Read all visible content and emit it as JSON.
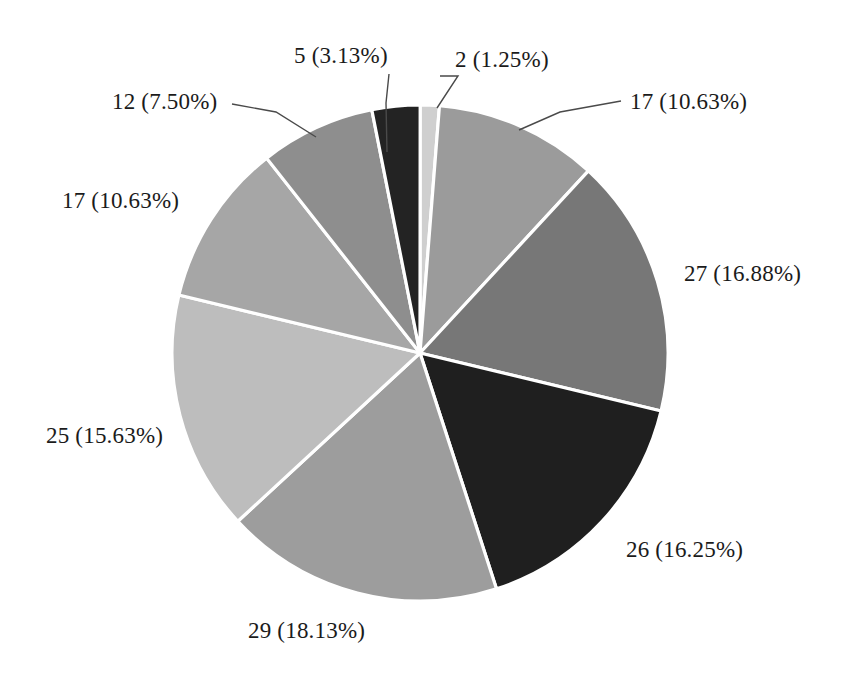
{
  "chart_data": {
    "type": "pie",
    "title": "",
    "subtitle": "",
    "xlabel": "",
    "ylabel": "",
    "legend": "none",
    "grid": false,
    "total": 160,
    "start_angle_deg": 0,
    "direction": "clockwise",
    "categories": [
      "2 (1.25%)",
      "17 (10.63%)",
      "27 (16.88%)",
      "26 (16.25%)",
      "29 (18.13%)",
      "25 (15.63%)",
      "17 (10.63%)",
      "12 (7.50%)",
      "5 (3.13%)"
    ],
    "values": [
      2,
      17,
      27,
      26,
      29,
      25,
      17,
      12,
      5
    ],
    "percents": [
      1.25,
      10.63,
      16.88,
      16.25,
      18.13,
      15.63,
      10.63,
      7.5,
      3.13
    ],
    "slices": [
      {
        "label": "2 (1.25%)",
        "value": 2,
        "percent": 1.25,
        "color": "#cfcfcf",
        "sweep_deg": 4.5,
        "start_deg": 0
      },
      {
        "label": "17 (10.63%)",
        "value": 17,
        "percent": 10.63,
        "color": "#9b9b9b",
        "sweep_deg": 38.27,
        "start_deg": 4.5
      },
      {
        "label": "27 (16.88%)",
        "value": 27,
        "percent": 16.88,
        "color": "#777777",
        "sweep_deg": 60.75,
        "start_deg": 42.77
      },
      {
        "label": "26 (16.25%)",
        "value": 26,
        "percent": 16.25,
        "color": "#1f1f1f",
        "sweep_deg": 58.5,
        "start_deg": 103.52
      },
      {
        "label": "29 (18.13%)",
        "value": 29,
        "percent": 18.13,
        "color": "#9d9d9d",
        "sweep_deg": 65.25,
        "start_deg": 162.02
      },
      {
        "label": "25 (15.63%)",
        "value": 25,
        "percent": 15.63,
        "color": "#bdbdbd",
        "sweep_deg": 56.25,
        "start_deg": 227.27
      },
      {
        "label": "17 (10.63%)",
        "value": 17,
        "percent": 10.63,
        "color": "#a6a6a6",
        "sweep_deg": 38.27,
        "start_deg": 283.52
      },
      {
        "label": "12 (7.50%)",
        "value": 12,
        "percent": 7.5,
        "color": "#8e8e8e",
        "sweep_deg": 27.0,
        "start_deg": 321.79
      },
      {
        "label": "5 (3.13%)",
        "value": 5,
        "percent": 3.13,
        "color": "#232323",
        "sweep_deg": 11.25,
        "start_deg": 348.79
      }
    ],
    "colors": {
      "background": "#ffffff",
      "slice_border": "#ffffff",
      "label_text": "#1b1b1b",
      "leader_line": "#4a4a4a"
    },
    "geometry": {
      "center_x": 420,
      "center_y": 353,
      "radius": 248
    }
  },
  "labels": [
    {
      "text": "5 (3.13%)",
      "x": 294,
      "y": 44,
      "name": "pie-label-5"
    },
    {
      "text": "2 (1.25%)",
      "x": 455,
      "y": 48,
      "name": "pie-label-2"
    },
    {
      "text": "17 (10.63%)",
      "x": 630,
      "y": 90,
      "name": "pie-label-17-right"
    },
    {
      "text": "27 (16.88%)",
      "x": 684,
      "y": 262,
      "name": "pie-label-27"
    },
    {
      "text": "26 (16.25%)",
      "x": 626,
      "y": 538,
      "name": "pie-label-26"
    },
    {
      "text": "29 (18.13%)",
      "x": 248,
      "y": 619,
      "name": "pie-label-29"
    },
    {
      "text": "25 (15.63%)",
      "x": 46,
      "y": 424,
      "name": "pie-label-25"
    },
    {
      "text": "17 (10.63%)",
      "x": 62,
      "y": 189,
      "name": "pie-label-17-left"
    },
    {
      "text": "12 (7.50%)",
      "x": 112,
      "y": 90,
      "name": "pie-label-12"
    }
  ],
  "leaders": [
    {
      "name": "leader-line-5",
      "points": "389,74 386,103 387,152"
    },
    {
      "name": "leader-line-2",
      "points": "440,76 458,76 437,108"
    },
    {
      "name": "leader-line-17-right",
      "points": "621,101 560,112 519,130"
    },
    {
      "name": "leader-line-12",
      "points": "232,104 276,112 316,137"
    }
  ]
}
